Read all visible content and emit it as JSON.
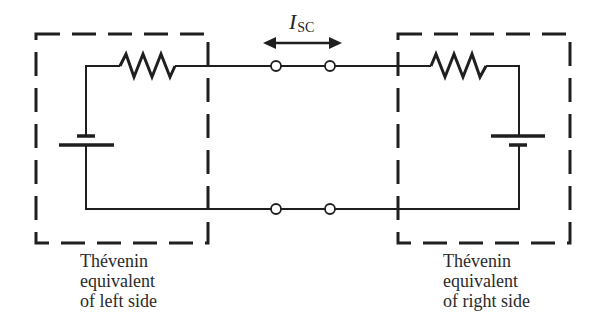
{
  "diagram": {
    "type": "circuit-schematic",
    "current_label": {
      "symbol": "I",
      "subscript": "SC"
    },
    "left_box": {
      "caption": [
        "Thévenin",
        "equivalent",
        "of left side"
      ],
      "components": [
        "resistor",
        "battery"
      ]
    },
    "right_box": {
      "caption": [
        "Thévenin",
        "equivalent",
        "of right side"
      ],
      "components": [
        "resistor",
        "battery"
      ]
    },
    "terminals": 4,
    "colors": {
      "ink": "#1f1f1f",
      "background": "#ffffff"
    }
  }
}
